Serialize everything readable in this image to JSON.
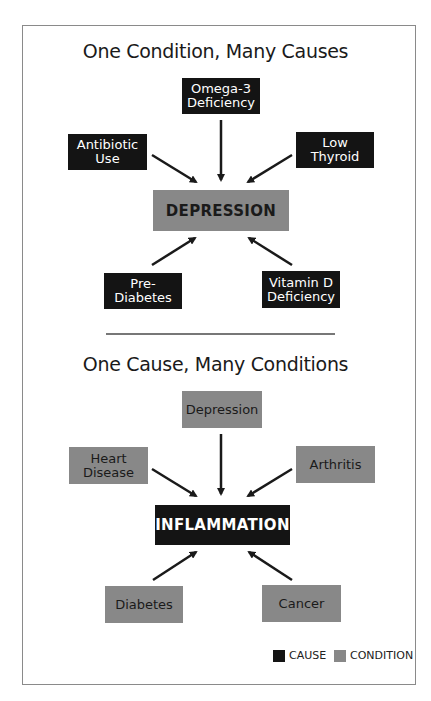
{
  "diagram": {
    "top": {
      "title": "One Condition, Many Causes",
      "center": "DEPRESSION",
      "nodes": [
        {
          "label": "Omega-3\nDeficiency",
          "type": "cause"
        },
        {
          "label": "Antibiotic\nUse",
          "type": "cause"
        },
        {
          "label": "Low\nThyroid",
          "type": "cause"
        },
        {
          "label": "Pre-\nDiabetes",
          "type": "cause"
        },
        {
          "label": "Vitamin D\nDeficiency",
          "type": "cause"
        }
      ]
    },
    "bottom": {
      "title": "One Cause, Many Conditions",
      "center": "INFLAMMATION",
      "nodes": [
        {
          "label": "Depression",
          "type": "condition"
        },
        {
          "label": "Heart\nDisease",
          "type": "condition"
        },
        {
          "label": "Arthritis",
          "type": "condition"
        },
        {
          "label": "Diabetes",
          "type": "condition"
        },
        {
          "label": "Cancer",
          "type": "condition"
        }
      ]
    },
    "legend": [
      {
        "label": "CAUSE",
        "color": "#141414"
      },
      {
        "label": "CONDITION",
        "color": "#888888"
      }
    ]
  }
}
